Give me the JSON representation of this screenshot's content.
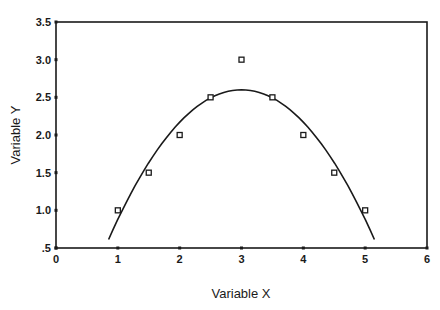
{
  "chart_data": {
    "type": "scatter",
    "title": "",
    "xlabel": "Variable X",
    "ylabel": "Variable Y",
    "xlim": [
      0,
      6
    ],
    "ylim": [
      0.5,
      3.5
    ],
    "x_ticks": [
      0,
      1,
      2,
      3,
      4,
      5,
      6
    ],
    "x_tick_labels": [
      "0",
      "1",
      "2",
      "3",
      "4",
      "5",
      "6"
    ],
    "y_ticks": [
      0.5,
      1.0,
      1.5,
      2.0,
      2.5,
      3.0,
      3.5
    ],
    "y_tick_labels": [
      ".5",
      "1.0",
      "1.5",
      "2.0",
      "2.5",
      "3.0",
      "3.5"
    ],
    "grid": false,
    "legend": null,
    "series": [
      {
        "name": "Observed",
        "kind": "scatter",
        "marker": "open-square",
        "x": [
          1.0,
          1.5,
          2.0,
          2.5,
          3.0,
          3.5,
          4.0,
          4.5,
          5.0
        ],
        "y": [
          1.0,
          1.5,
          2.0,
          2.5,
          3.0,
          2.5,
          2.0,
          1.5,
          1.0
        ]
      },
      {
        "name": "Quadratic fit",
        "kind": "line",
        "equation": "y = 2.6 - 0.43*(x-3)^2",
        "x_range": [
          0.85,
          5.15
        ],
        "peak": {
          "x": 3.0,
          "y": 2.6
        }
      }
    ]
  },
  "colors": {
    "axis": "#1a1a1a",
    "line": "#1a1a1a",
    "marker": "#1a1a1a",
    "background": "#ffffff"
  }
}
